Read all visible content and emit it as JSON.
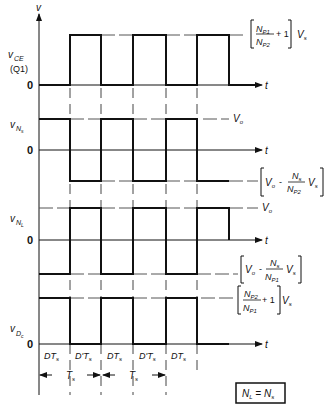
{
  "figure": {
    "y_axis_label": "v",
    "t_label": "t",
    "zero_label": "0",
    "note_box": "N_L = N_s"
  },
  "waveforms": [
    {
      "name": "v_CE",
      "label": "v",
      "label_sub": "CE",
      "label_extra": "(Q1)",
      "high_level_label": "[N_P1/N_P2 + 1] V_s",
      "low_level_label": "0"
    },
    {
      "name": "v_Ns",
      "label": "v",
      "label_sub": "N_s",
      "high_level_label": "V_o",
      "low_level_label": "[V_o - (N_s/N_P2) V_s]"
    },
    {
      "name": "v_NL",
      "label": "v",
      "label_sub": "N_L",
      "high_level_label": "V_o",
      "low_level_label": "[V_o - (N_s/N_P1) V_s]"
    },
    {
      "name": "v_Dc",
      "label": "v",
      "label_sub": "D_c",
      "high_level_label": "[N_P2/N_P1 + 1] V_s",
      "low_level_label": "0"
    }
  ],
  "intervals": [
    "DT_s",
    "D'T_s",
    "DT_s",
    "D'T_s",
    "DT_s"
  ],
  "periods": [
    "T_s",
    "T_s"
  ],
  "chart_data": {
    "type": "line",
    "title": "",
    "xlabel": "t",
    "ylabel": "v",
    "x_edges": [
      0,
      1,
      2,
      3,
      4,
      5
    ],
    "x_edge_labels": [
      "0",
      "DT_s",
      "T_s",
      "T_s+DT_s",
      "2T_s",
      "2T_s+DT_s"
    ],
    "series": [
      {
        "name": "v_CE (Q1)",
        "levels": [
          "0",
          "(N_P1/N_P2 + 1)V_s",
          "0",
          "(N_P1/N_P2 + 1)V_s",
          "0",
          "(N_P1/N_P2 + 1)V_s"
        ]
      },
      {
        "name": "v_Ns",
        "levels": [
          "V_o",
          "V_o - (N_s/N_P2)V_s",
          "V_o",
          "V_o - (N_s/N_P2)V_s",
          "V_o",
          "V_o - (N_s/N_P2)V_s"
        ]
      },
      {
        "name": "v_NL",
        "levels": [
          "V_o - (N_s/N_P1)V_s",
          "V_o",
          "V_o - (N_s/N_P1)V_s",
          "V_o",
          "V_o - (N_s/N_P1)V_s",
          "V_o"
        ]
      },
      {
        "name": "v_Dc",
        "levels": [
          "(N_P2/N_P1 + 1)V_s",
          "0",
          "(N_P2/N_P1 + 1)V_s",
          "0",
          "(N_P2/N_P1 + 1)V_s",
          "0"
        ]
      }
    ],
    "annotations": [
      "N_L = N_s",
      "DT_s",
      "D'T_s",
      "T_s"
    ]
  }
}
